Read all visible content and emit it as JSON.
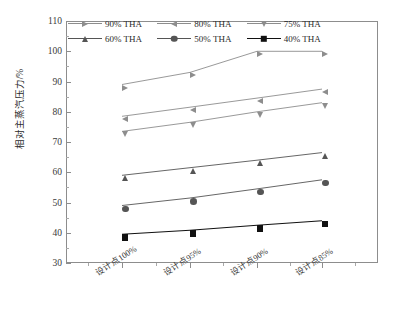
{
  "chart_data": {
    "type": "line",
    "title": "",
    "xlabel": "",
    "ylabel": "相对主蒸汽压力/%",
    "categories": [
      "设计点100%",
      "设计点95%",
      "设计点90%",
      "设计点85%"
    ],
    "ylim": [
      30,
      110
    ],
    "ytick_labels": [
      "30",
      "40",
      "50",
      "60",
      "70",
      "80",
      "90",
      "100",
      "110"
    ],
    "ytick_step": 10,
    "grid": false,
    "legend_position": "top-inside",
    "series": [
      {
        "name": "90% THA",
        "marker": "triangle-right",
        "color": "#8d8d8d",
        "values": [
          89.0,
          93.0,
          100.0,
          100.0
        ]
      },
      {
        "name": "80% THA",
        "marker": "triangle-left",
        "color": "#8d8d8d",
        "values": [
          78.5,
          81.5,
          84.5,
          87.5
        ]
      },
      {
        "name": "75% THA",
        "marker": "triangle-down",
        "color": "#8d8d8d",
        "values": [
          73.5,
          76.5,
          80.0,
          83.0
        ]
      },
      {
        "name": "60% THA",
        "marker": "triangle-up",
        "color": "#555555",
        "values": [
          59.0,
          61.5,
          64.0,
          66.5
        ]
      },
      {
        "name": "50% THA",
        "marker": "circle",
        "color": "#555555",
        "values": [
          49.0,
          51.5,
          54.5,
          57.5
        ]
      },
      {
        "name": "40% THA",
        "marker": "square",
        "color": "#111111",
        "values": [
          39.5,
          40.8,
          42.5,
          44.0
        ]
      }
    ]
  },
  "legend": {
    "items": [
      {
        "label": "90% THA",
        "marker": "triangle-right-icon"
      },
      {
        "label": "80% THA",
        "marker": "triangle-left-icon"
      },
      {
        "label": "75% THA",
        "marker": "triangle-down-icon"
      },
      {
        "label": "60% THA",
        "marker": "triangle-up-icon"
      },
      {
        "label": "50% THA",
        "marker": "circle-icon"
      },
      {
        "label": "40% THA",
        "marker": "square-icon"
      }
    ]
  },
  "axes": {
    "y_title": "相对主蒸汽压力/%",
    "y_ticks": [
      "110",
      "100",
      "90",
      "80",
      "70",
      "60",
      "50",
      "40",
      "30"
    ],
    "x_ticks": [
      "设计点100%",
      "设计点95%",
      "设计点90%",
      "设计点85%"
    ]
  },
  "caption": {
    "text": ""
  },
  "colors": {
    "axis": "#8d8d8d",
    "series_light": "#8d8d8d",
    "series_mid": "#555555",
    "series_dark": "#111111",
    "text": "#2b2b2b"
  }
}
